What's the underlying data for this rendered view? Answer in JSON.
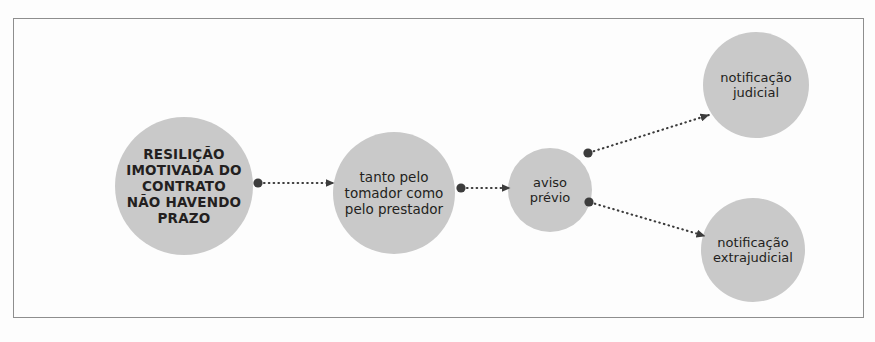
{
  "diagram": {
    "title_text": "",
    "frame": {
      "x": 13,
      "y": 18,
      "width": 851,
      "height": 300,
      "border_color": "#8e8e8e"
    },
    "background_color": "#fdfdfd",
    "node_fill_color": "#c9c9c9",
    "connector_color": "#3c3c3c",
    "text_color": "#231f20",
    "nodes": [
      {
        "id": "resilicao",
        "label": "RESILIÇÃO\nIMOTIVADA DO\nCONTRATO\nNÃO HAVENDO\nPRAZO",
        "cx": 184,
        "cy": 186,
        "r": 69,
        "bold": true,
        "font_size": 13.5
      },
      {
        "id": "tomador-prestador",
        "label": "tanto pelo\ntomador como\npelo prestador",
        "cx": 394,
        "cy": 193,
        "r": 61,
        "bold": false,
        "font_size": 13.5
      },
      {
        "id": "aviso-previo",
        "label": "aviso\nprévio",
        "cx": 550,
        "cy": 190,
        "r": 42,
        "bold": false,
        "font_size": 13
      },
      {
        "id": "notificacao-judicial",
        "label": "notificação\njudicial",
        "cx": 756,
        "cy": 85,
        "r": 53,
        "bold": false,
        "font_size": 13
      },
      {
        "id": "notificacao-extrajudicial",
        "label": "notificação\nextrajudicial",
        "cx": 753,
        "cy": 250,
        "r": 52,
        "bold": false,
        "font_size": 13
      }
    ],
    "connectors": [
      {
        "id": "resilicao-to-tomador",
        "from": "resilicao",
        "to": "tomador-prestador",
        "x1": 258,
        "y1": 183,
        "x2": 334,
        "y2": 183,
        "style": "dotted-with-dot-and-arrow"
      },
      {
        "id": "tomador-to-aviso",
        "from": "tomador-prestador",
        "to": "aviso-previo",
        "x1": 461,
        "y1": 188,
        "x2": 510,
        "y2": 188,
        "style": "dotted-with-dot-and-arrow"
      },
      {
        "id": "aviso-to-judicial",
        "from": "aviso-previo",
        "to": "notificacao-judicial",
        "x1": 588,
        "y1": 153,
        "x2": 709,
        "y2": 115,
        "style": "dotted-with-dot-and-arrow"
      },
      {
        "id": "aviso-to-extrajudicial",
        "from": "aviso-previo",
        "to": "notificacao-extrajudicial",
        "x1": 589,
        "y1": 202,
        "x2": 705,
        "y2": 236,
        "style": "dotted-with-dot-and-arrow"
      }
    ]
  }
}
